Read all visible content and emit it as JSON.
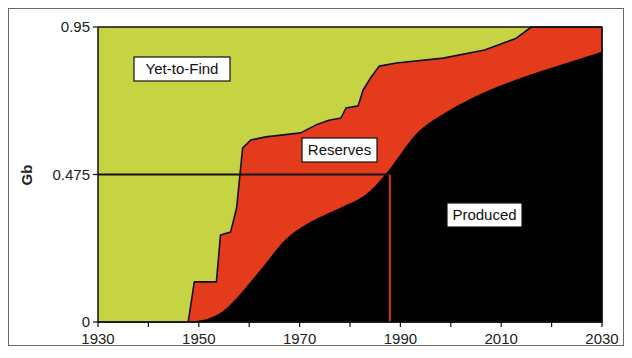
{
  "chart_data": {
    "type": "area",
    "title": "",
    "xlabel": "",
    "ylabel": "Gb",
    "xlim": [
      1930,
      2030
    ],
    "ylim": [
      0,
      0.95
    ],
    "grid": false,
    "x_ticks": [
      1930,
      1950,
      1970,
      1990,
      2010,
      2030
    ],
    "x_tick_labels": [
      "1930",
      "1950",
      "1970",
      "1990",
      "2010",
      "2030"
    ],
    "y_ticks": [
      0,
      0.475,
      0.95
    ],
    "y_tick_labels": [
      "0",
      "0.475",
      "0.95"
    ],
    "series": [
      {
        "name": "Cumulative discovery (Yet-to-Find boundary)",
        "step": true,
        "points": [
          [
            1930,
            0
          ],
          [
            1947.9,
            0
          ],
          [
            1949.1,
            0.129
          ],
          [
            1953.5,
            0.129
          ],
          [
            1954.3,
            0.28
          ],
          [
            1956.3,
            0.29
          ],
          [
            1957.5,
            0.367
          ],
          [
            1958.7,
            0.56
          ],
          [
            1960.3,
            0.586
          ],
          [
            1963.3,
            0.596
          ],
          [
            1970.2,
            0.609
          ],
          [
            1973.2,
            0.634
          ],
          [
            1975.8,
            0.65
          ],
          [
            1978.2,
            0.657
          ],
          [
            1979.2,
            0.689
          ],
          [
            1981.6,
            0.696
          ],
          [
            1982.6,
            0.747
          ],
          [
            1984.2,
            0.789
          ],
          [
            1985.8,
            0.824
          ],
          [
            1989.2,
            0.834
          ],
          [
            1998.5,
            0.85
          ],
          [
            2006.7,
            0.876
          ],
          [
            2013.0,
            0.914
          ],
          [
            2016.0,
            0.95
          ],
          [
            2030,
            0.95
          ]
        ]
      },
      {
        "name": "Cumulative production",
        "step": false,
        "points": [
          [
            1947.9,
            0
          ],
          [
            1952.2,
            0.013
          ],
          [
            1956.2,
            0.055
          ],
          [
            1962.2,
            0.167
          ],
          [
            1967.1,
            0.264
          ],
          [
            1972.1,
            0.322
          ],
          [
            1978.0,
            0.367
          ],
          [
            1983.0,
            0.409
          ],
          [
            1986.9,
            0.473
          ],
          [
            1989.9,
            0.538
          ],
          [
            1993.9,
            0.618
          ],
          [
            1999.8,
            0.683
          ],
          [
            2007.7,
            0.747
          ],
          [
            2015.6,
            0.795
          ],
          [
            2023.6,
            0.837
          ],
          [
            2030,
            0.87
          ]
        ]
      }
    ],
    "regions": [
      {
        "name": "Yet-to-Find",
        "color": "#c6d444"
      },
      {
        "name": "Reserves",
        "color": "#e33b1c"
      },
      {
        "name": "Produced",
        "color": "#000000"
      }
    ],
    "annotations": [
      {
        "type": "hline",
        "y": 0.475,
        "x_from": 1930,
        "x_to": 1987.7,
        "color": "#111111"
      },
      {
        "type": "vline",
        "x": 1987.9,
        "y_from": 0,
        "y_to": 0.475,
        "color": "#d4381c"
      }
    ],
    "labels": {
      "yet_to_find": "Yet-to-Find",
      "reserves": "Reserves",
      "produced": "Produced"
    }
  }
}
